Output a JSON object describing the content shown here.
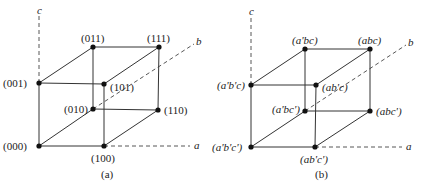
{
  "figures": [
    {
      "caption": "(a)",
      "axes": {
        "a": "a",
        "b": "b",
        "c": "c"
      },
      "vertices": {
        "v000": "(000)",
        "v100": "(100)",
        "v001": "(001)",
        "v101": "(101)",
        "v010": "(010)",
        "v110": "(110)",
        "v011": "(011)",
        "v111": "(111)"
      }
    },
    {
      "caption": "(b)",
      "axes": {
        "a": "a",
        "b": "b",
        "c": "c"
      },
      "vertices": {
        "v000": "(a'b'c')",
        "v100": "(ab'c')",
        "v001": "(a'b'c)",
        "v101": "(ab'c)",
        "v010": "(a'bc')",
        "v110": "(abc')",
        "v011": "(a'bc)",
        "v111": "(abc)"
      }
    }
  ]
}
